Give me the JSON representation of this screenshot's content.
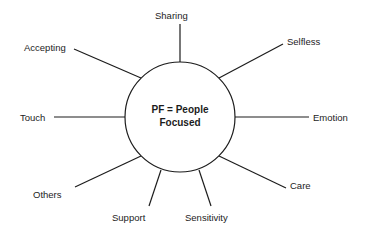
{
  "diagram": {
    "type": "hub-and-spoke",
    "title": "PF = People Focused",
    "center": {
      "line1": "PF = People",
      "line2": "Focused",
      "shape": "circle",
      "cx": 180,
      "cy": 117,
      "r": 55,
      "stroke": "#1c1c1c",
      "fill": "#ffffff"
    },
    "background_color": "#ffffff",
    "line_color": "#1c1c1c",
    "text_color": "#1c1c1c",
    "spokes": [
      {
        "label": "Sharing",
        "angle_deg": 90,
        "label_left": 155,
        "label_top": 10,
        "line_x1": 180,
        "line_y1": 62,
        "line_x2": 180,
        "line_y2": 24
      },
      {
        "label": "Selfless",
        "angle_deg": 45,
        "label_left": 287,
        "label_top": 36,
        "line_x1": 219,
        "line_y1": 78,
        "line_x2": 283,
        "line_y2": 44
      },
      {
        "label": "Emotion",
        "angle_deg": 0,
        "label_left": 313,
        "label_top": 112,
        "line_x1": 235,
        "line_y1": 117,
        "line_x2": 309,
        "line_y2": 117
      },
      {
        "label": "Care",
        "angle_deg": -45,
        "label_left": 290,
        "label_top": 180,
        "line_x1": 219,
        "line_y1": 156,
        "line_x2": 286,
        "line_y2": 188
      },
      {
        "label": "Sensitivity",
        "angle_deg": -70,
        "label_left": 185,
        "label_top": 212,
        "line_x1": 199,
        "line_y1": 170,
        "line_x2": 211,
        "line_y2": 206
      },
      {
        "label": "Support",
        "angle_deg": -110,
        "label_left": 112,
        "label_top": 212,
        "line_x1": 161,
        "line_y1": 170,
        "line_x2": 149,
        "line_y2": 206
      },
      {
        "label": "Others",
        "angle_deg": -135,
        "label_left": 33,
        "label_top": 189,
        "line_x1": 141,
        "line_y1": 156,
        "line_x2": 75,
        "line_y2": 187
      },
      {
        "label": "Touch",
        "angle_deg": 180,
        "label_left": 20,
        "label_top": 112,
        "line_x1": 125,
        "line_y1": 117,
        "line_x2": 54,
        "line_y2": 117
      },
      {
        "label": "Accepting",
        "angle_deg": 135,
        "label_left": 24,
        "label_top": 42,
        "line_x1": 141,
        "line_y1": 78,
        "line_x2": 74,
        "line_y2": 49
      }
    ]
  }
}
